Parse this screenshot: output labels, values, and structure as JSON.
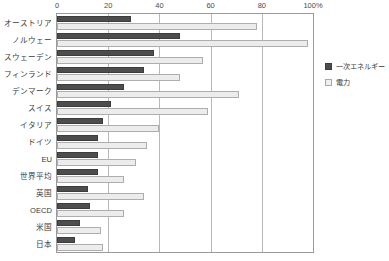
{
  "chart_data": {
    "type": "bar",
    "orientation": "horizontal",
    "title": "",
    "subtitle": "",
    "xlabel": "",
    "ylabel": "",
    "xlim": [
      0,
      100
    ],
    "x_unit": "%",
    "x_ticks": [
      0,
      20,
      40,
      60,
      80,
      100
    ],
    "x_tick_labels": [
      "0",
      "20",
      "40",
      "60",
      "80",
      "100%"
    ],
    "grid": "vertical-only",
    "legend_position": "right",
    "categories": [
      "オーストリア",
      "ノルウェー",
      "スウェーデン",
      "フィンランド",
      "デンマーク",
      "スイス",
      "イタリア",
      "ドイツ",
      "EU",
      "世界平均",
      "英国",
      "OECD",
      "米国",
      "日本"
    ],
    "series": [
      {
        "name": "一次エネルギー",
        "color": "#4d4d4d",
        "values": [
          29,
          48,
          38,
          34,
          26,
          21,
          18,
          16,
          16,
          16,
          12,
          13,
          9,
          7
        ]
      },
      {
        "name": "電力",
        "color": "#ececec",
        "values": [
          78,
          98,
          57,
          48,
          71,
          59,
          40,
          35,
          31,
          26,
          34,
          26,
          17,
          18
        ]
      }
    ]
  },
  "legend": {
    "items": [
      {
        "label": "一次エネルギー",
        "style": "primary"
      },
      {
        "label": "電力",
        "style": "electricity"
      }
    ]
  }
}
